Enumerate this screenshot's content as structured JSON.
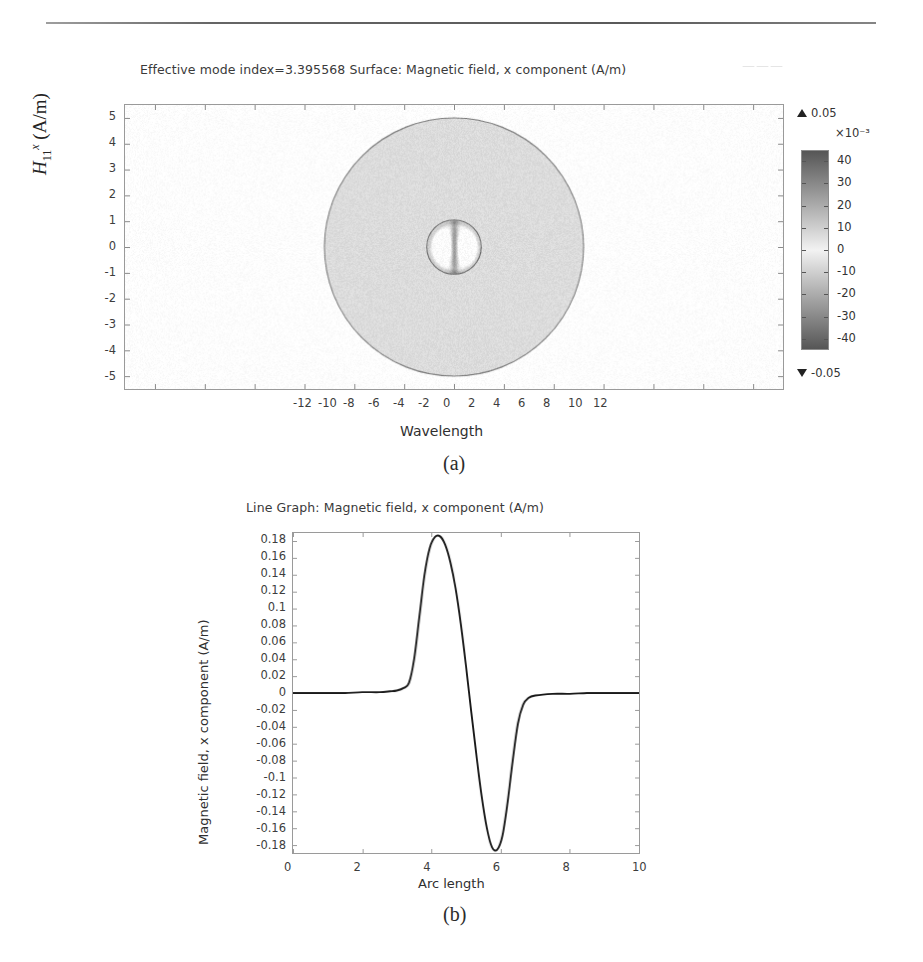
{
  "figure": {
    "panel_a_caption": "(a)",
    "panel_b_caption": "(b)",
    "scan_artifact_text": "———"
  },
  "panel_a": {
    "title": "Effective mode index=3.395568   Surface: Magnetic field, x component (A/m)",
    "title_parts": {
      "mode_index_label": "Effective mode index=",
      "mode_index_value": "3.395568",
      "surface_label": "Surface: Magnetic field, x component (A/m)"
    },
    "xlabel": "Wavelength",
    "ylabel_plain": "H11x (A/m)",
    "ylabel_base": "H",
    "ylabel_sub": "11",
    "ylabel_sup": "x",
    "ylabel_unit": "(A/m)",
    "xticks": [
      "-12",
      "-10",
      "-8",
      "-6",
      "-4",
      "-2",
      "0",
      "2",
      "4",
      "6",
      "8",
      "10",
      "12"
    ],
    "yticks": [
      "5",
      "4",
      "3",
      "2",
      "1",
      "0",
      "-1",
      "-2",
      "-3",
      "-4",
      "-5"
    ],
    "colorbar": {
      "max_label": "0.05",
      "min_label": "-0.05",
      "exponent": "×10⁻³",
      "ticks": [
        "40",
        "30",
        "20",
        "10",
        "0",
        "-10",
        "-20",
        "-30",
        "-40"
      ],
      "high_color": "#565656",
      "low_color": "#565656",
      "mid_color": "#f2f2f2"
    }
  },
  "panel_b": {
    "title": "Line Graph: Magnetic field, x component (A/m)",
    "xlabel": "Arc length",
    "ylabel": "Magnetic field, x component (A/m)",
    "xticks": [
      "0",
      "2",
      "4",
      "6",
      "8",
      "10"
    ],
    "yticks": [
      "0.18",
      "0.16",
      "0.14",
      "0.12",
      "0.1",
      "0.08",
      "0.06",
      "0.04",
      "0.02",
      "0",
      "-0.02",
      "-0.04",
      "-0.06",
      "-0.08",
      "-0.1",
      "-0.12",
      "-0.14",
      "-0.16",
      "-0.18"
    ],
    "line_color": "#1a1a1a"
  },
  "chart_data": [
    {
      "type": "heatmap",
      "title": "Effective mode index=3.395568   Surface: Magnetic field, x component (A/m)",
      "xlabel": "Wavelength",
      "ylabel": "H11x (A/m)",
      "xlim": [
        -13.2,
        13.2
      ],
      "ylim": [
        -5.5,
        5.5
      ],
      "xticks": [
        -12,
        -10,
        -8,
        -6,
        -4,
        -2,
        0,
        2,
        4,
        6,
        8,
        10,
        12
      ],
      "yticks": [
        -5,
        -4,
        -3,
        -2,
        -1,
        0,
        1,
        2,
        3,
        4,
        5
      ],
      "grid": false,
      "colorbar": {
        "label": "×10⁻³",
        "vmin": -0.05,
        "vmax": 0.05,
        "ticks": [
          40,
          30,
          20,
          10,
          0,
          -10,
          -20,
          -30,
          -40
        ],
        "tick_scale": 0.001,
        "colormap": "grayscale"
      },
      "geometry": {
        "cladding_circle": {
          "cx": 0,
          "cy": 0,
          "r": 5.0,
          "fill_value": 0.0
        },
        "core_circle": {
          "cx": 0,
          "cy": 0,
          "r": 1.05,
          "fill_value": 0.0
        },
        "core_lobes": [
          {
            "cx": -0.45,
            "cy": 0.0,
            "peak_value": -0.04
          },
          {
            "cx": 0.45,
            "cy": 0.0,
            "peak_value": -0.04
          }
        ],
        "core_center_band": {
          "cx": 0,
          "cy": 0,
          "value": 0.045
        }
      },
      "annotations": [
        "effective mode index = 3.395568"
      ]
    },
    {
      "type": "line",
      "title": "Line Graph: Magnetic field, x component (A/m)",
      "xlabel": "Arc length",
      "ylabel": "Magnetic field, x component (A/m)",
      "xlim": [
        0,
        10
      ],
      "ylim": [
        -0.19,
        0.19
      ],
      "xticks": [
        0,
        2,
        4,
        6,
        8,
        10
      ],
      "yticks": [
        0.18,
        0.16,
        0.14,
        0.12,
        0.1,
        0.08,
        0.06,
        0.04,
        0.02,
        0,
        -0.02,
        -0.04,
        -0.06,
        -0.08,
        -0.1,
        -0.12,
        -0.14,
        -0.16,
        -0.18
      ],
      "grid": false,
      "legend": null,
      "series": [
        {
          "name": "Magnetic field, x component (A/m)",
          "x": [
            0.0,
            0.5,
            1.0,
            1.5,
            2.0,
            2.5,
            2.8,
            3.0,
            3.2,
            3.35,
            3.5,
            3.65,
            3.8,
            3.95,
            4.1,
            4.25,
            4.4,
            4.55,
            4.7,
            4.85,
            5.0,
            5.15,
            5.3,
            5.45,
            5.6,
            5.75,
            5.9,
            6.05,
            6.2,
            6.35,
            6.5,
            6.65,
            6.8,
            7.0,
            7.5,
            8.0,
            8.5,
            9.0,
            9.5,
            10.0
          ],
          "y": [
            0.0,
            0.0,
            0.0,
            0.0,
            0.001,
            0.001,
            0.002,
            0.003,
            0.006,
            0.012,
            0.04,
            0.09,
            0.14,
            0.172,
            0.185,
            0.186,
            0.176,
            0.155,
            0.124,
            0.082,
            0.032,
            -0.022,
            -0.074,
            -0.122,
            -0.16,
            -0.183,
            -0.186,
            -0.17,
            -0.13,
            -0.08,
            -0.036,
            -0.014,
            -0.006,
            -0.003,
            -0.001,
            -0.001,
            0.0,
            0.0,
            0.0,
            0.0
          ]
        }
      ]
    }
  ]
}
